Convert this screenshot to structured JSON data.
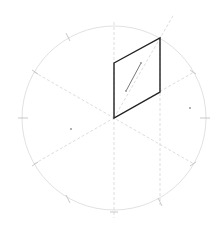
{
  "diagram": {
    "type": "isometric-construction",
    "colors": {
      "background": "#ffffff",
      "circle": "#e2e2e2",
      "guide": "#d4d4d4",
      "shape": "#222222",
      "segment": "#555555",
      "dot": "#999999"
    },
    "circle": {
      "cx": 114,
      "cy": 118,
      "r": 92
    },
    "parallelogram": [
      [
        114,
        63
      ],
      [
        160,
        38
      ],
      [
        160,
        92
      ],
      [
        114,
        118
      ]
    ],
    "inner_segment": {
      "x1": 126,
      "y1": 91,
      "x2": 141,
      "y2": 63
    },
    "guides": [
      {
        "x1": 114,
        "y1": 22,
        "x2": 114,
        "y2": 218
      },
      {
        "x1": 160,
        "y1": 38,
        "x2": 160,
        "y2": 205
      },
      {
        "x1": 34,
        "y1": 164,
        "x2": 194,
        "y2": 72
      },
      {
        "x1": 34,
        "y1": 72,
        "x2": 194,
        "y2": 164
      },
      {
        "x1": 114,
        "y1": 118,
        "x2": 174,
        "y2": 14
      }
    ],
    "ticks": [
      {
        "x1": 18,
        "y1": 118,
        "x2": 28,
        "y2": 118
      },
      {
        "x1": 200,
        "y1": 118,
        "x2": 210,
        "y2": 118
      },
      {
        "x1": 66,
        "y1": 33,
        "x2": 70,
        "y2": 41
      },
      {
        "x1": 66,
        "y1": 195,
        "x2": 70,
        "y2": 203
      },
      {
        "x1": 32,
        "y1": 70,
        "x2": 38,
        "y2": 74
      },
      {
        "x1": 32,
        "y1": 166,
        "x2": 38,
        "y2": 162
      },
      {
        "x1": 190,
        "y1": 70,
        "x2": 196,
        "y2": 74
      },
      {
        "x1": 190,
        "y1": 166,
        "x2": 196,
        "y2": 162
      },
      {
        "x1": 158,
        "y1": 198,
        "x2": 162,
        "y2": 206
      },
      {
        "x1": 110,
        "y1": 212,
        "x2": 118,
        "y2": 212
      }
    ],
    "dots": [
      {
        "cx": 71,
        "cy": 129
      },
      {
        "cx": 190,
        "cy": 108
      },
      {
        "cx": 126,
        "cy": 91
      },
      {
        "cx": 141,
        "cy": 63
      }
    ]
  }
}
